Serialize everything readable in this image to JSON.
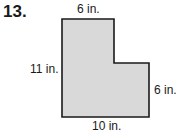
{
  "problem": {
    "number": "13.",
    "figure": {
      "shape": "L-shaped polygon",
      "fill": "#d9d9d9",
      "stroke": "#1a1a1a",
      "labels": {
        "top": "6 in.",
        "left": "11 in.",
        "right": "6 in.",
        "bottom": "10 in."
      }
    }
  }
}
